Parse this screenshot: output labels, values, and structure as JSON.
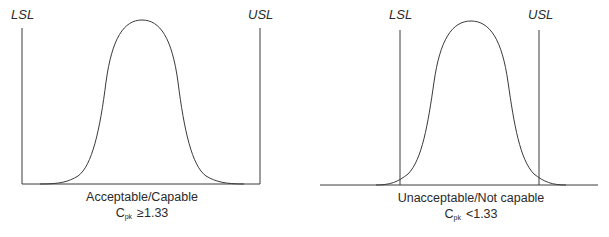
{
  "figure": {
    "left_panel": {
      "lsl_label": "LSL",
      "usl_label": "USL",
      "caption_line1": "Acceptable/Capable",
      "cpk_symbol": "C",
      "cpk_subscript": "pk",
      "cpk_condition": "≥1.33"
    },
    "right_panel": {
      "lsl_label": "LSL",
      "usl_label": "USL",
      "caption_line1": "Unacceptable/Not capable",
      "cpk_symbol": "C",
      "cpk_subscript": "pk",
      "cpk_condition": "<1.33"
    },
    "line_color": "#3a3a3a"
  }
}
